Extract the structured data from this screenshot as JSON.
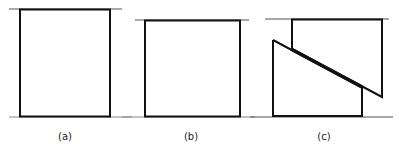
{
  "figure": {
    "panels": [
      {
        "id": "a",
        "label": "(a)",
        "description": "Rectangle between two horizontal reference lines"
      },
      {
        "id": "b",
        "label": "(b)",
        "description": "Square between two horizontal reference lines"
      },
      {
        "id": "c",
        "label": "(c)",
        "description": "Square cut along a diagonal with the two pieces slid past each other"
      }
    ],
    "colors": {
      "stroke": "#111111",
      "reference_line": "#555555",
      "background": "#ffffff"
    }
  }
}
